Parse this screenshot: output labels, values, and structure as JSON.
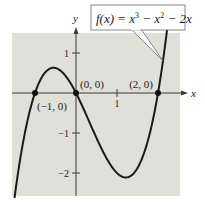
{
  "chart_data": {
    "type": "line",
    "title": "",
    "function_label": {
      "fx": "f(x) = x",
      "exp1": "3",
      "mid": " − x",
      "exp2": "2",
      "tail": " − 2x"
    },
    "function": "x^3 - x^2 - 2x",
    "xlabel": "x",
    "ylabel": "y",
    "xlim": [
      -1.55,
      2.55
    ],
    "ylim": [
      -2.6,
      1.6
    ],
    "x_ticks": [
      {
        "value": 1,
        "label": "1"
      }
    ],
    "y_ticks": [
      {
        "value": 1,
        "label": "1"
      },
      {
        "value": -1,
        "label": "−1"
      },
      {
        "value": -2,
        "label": "−2"
      }
    ],
    "points": [
      {
        "x": -1,
        "y": 0,
        "label": "(−1, 0)"
      },
      {
        "x": 0,
        "y": 0,
        "label": "(0, 0)"
      },
      {
        "x": 2,
        "y": 0,
        "label": "(2, 0)"
      }
    ],
    "series": [
      {
        "name": "f(x) = x^3 - x^2 - 2x",
        "x_range": [
          -1.5,
          2.24
        ]
      }
    ],
    "grid": false,
    "legend": "none",
    "colors": {
      "panel": "#dfe0d8",
      "curve": "#1a1a1a",
      "axis": "#3a3a3a"
    }
  }
}
